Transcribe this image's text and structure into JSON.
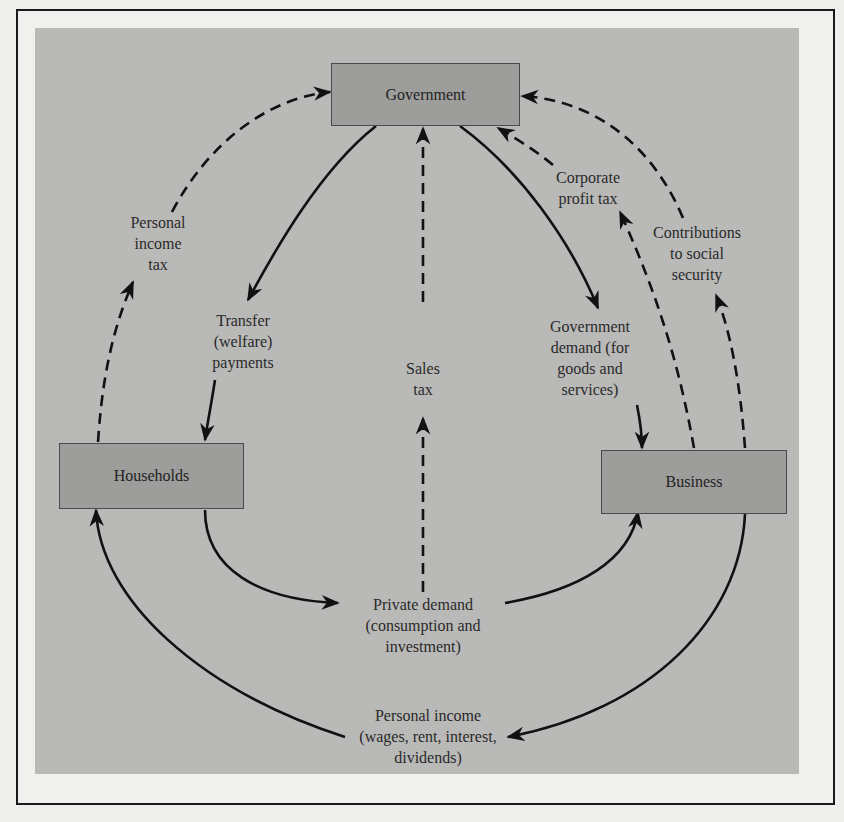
{
  "nodes": {
    "government": "Government",
    "households": "Households",
    "business": "Business"
  },
  "flows": {
    "personal_income_tax": "Personal\nincome\ntax",
    "transfer_payments": "Transfer\n(welfare)\npayments",
    "sales_tax": "Sales\ntax",
    "corporate_profit_tax": "Corporate\nprofit tax",
    "contributions_social_security": "Contributions\nto social\nsecurity",
    "government_demand": "Government\ndemand (for\ngoods and\nservices)",
    "private_demand": "Private demand\n(consumption and\ninvestment)",
    "personal_income": "Personal income\n(wages, rent, interest,\ndividends)"
  },
  "legend": {
    "solid_line": "real/monetary flow",
    "dashed_line": "tax flow"
  },
  "colors": {
    "panel": "#b9b9b7",
    "box": "#9d9d9b",
    "line": "#111111"
  }
}
